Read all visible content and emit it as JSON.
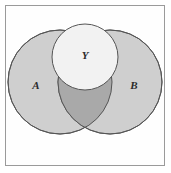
{
  "figure": {
    "kind": "venn-diagram",
    "width": 171,
    "height": 173,
    "background_color": "#ffffff",
    "frame": {
      "stroke_color": "#9a9a9a",
      "fill_color": "#fefefe",
      "x": 5,
      "y": 5,
      "width": 160,
      "height": 161
    }
  },
  "colors": {
    "set_fill": "#cfcfcf",
    "intersection_fill": "#a9a9a9",
    "top_circle_fill": "#f2f2f2",
    "outline": "#555555",
    "label_color": "#2b2b2b",
    "frame_stroke": "#9a9a9a"
  },
  "sets": [
    {
      "id": "A",
      "label": "A",
      "cx": 60,
      "cy": 82,
      "r": 52,
      "fill": "#cfcfcf",
      "label_x": 36,
      "label_y": 86
    },
    {
      "id": "B",
      "label": "B",
      "cx": 110,
      "cy": 82,
      "r": 52,
      "fill": "#cfcfcf",
      "label_x": 134,
      "label_y": 86
    },
    {
      "id": "Y",
      "label": "Y",
      "cx": 85,
      "cy": 57,
      "r": 33,
      "fill": "#f2f2f2",
      "label_x": 85,
      "label_y": 56
    }
  ],
  "regions": [
    {
      "id": "A-only",
      "label": "A",
      "shade": "light",
      "fill": "#cfcfcf"
    },
    {
      "id": "B-only",
      "label": "B",
      "shade": "light",
      "fill": "#cfcfcf"
    },
    {
      "id": "A-intersect-B",
      "label": "",
      "shade": "dark",
      "fill": "#a9a9a9"
    },
    {
      "id": "Y",
      "label": "Y",
      "shade": "lightest",
      "fill": "#f2f2f2"
    }
  ]
}
